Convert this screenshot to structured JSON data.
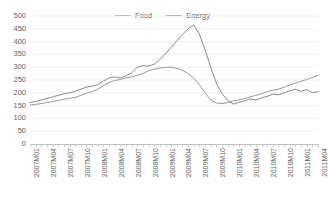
{
  "chart_data": {
    "type": "line",
    "title": "",
    "xlabel": "",
    "ylabel": "",
    "ylim": [
      0,
      500
    ],
    "ytick_step": 50,
    "yticks": [
      0,
      50,
      100,
      150,
      200,
      250,
      300,
      350,
      400,
      450,
      500
    ],
    "grid": true,
    "legend_position": "top-center",
    "x_tick_labels": [
      "2007M01",
      "2007M04",
      "2007M07",
      "2007M10",
      "2008M01",
      "2008M04",
      "2008M07",
      "2008M10",
      "2009M01",
      "2009M04",
      "2009M07",
      "2009M10",
      "2010M01",
      "2010M04",
      "2010M07",
      "2010M10",
      "2011M01",
      "2011M04"
    ],
    "x": [
      "2007M01",
      "2007M02",
      "2007M03",
      "2007M04",
      "2007M05",
      "2007M06",
      "2007M07",
      "2007M08",
      "2007M09",
      "2007M10",
      "2007M11",
      "2007M12",
      "2008M01",
      "2008M02",
      "2008M03",
      "2008M04",
      "2008M05",
      "2008M06",
      "2008M07",
      "2008M08",
      "2008M09",
      "2008M10",
      "2008M11",
      "2008M12",
      "2009M01",
      "2009M02",
      "2009M03",
      "2009M04",
      "2009M05",
      "2009M06",
      "2009M07",
      "2009M08",
      "2009M09",
      "2009M10",
      "2009M11",
      "2009M12",
      "2010M01",
      "2010M02",
      "2010M03",
      "2010M04",
      "2010M05",
      "2010M06",
      "2010M07",
      "2010M08",
      "2010M09",
      "2010M10",
      "2010M11",
      "2010M12",
      "2011M01",
      "2011M02",
      "2011M03",
      "2011M04"
    ],
    "series": [
      {
        "name": "Food",
        "color": "#8c8c8c",
        "values": [
          152,
          155,
          158,
          162,
          166,
          170,
          175,
          178,
          182,
          190,
          198,
          205,
          214,
          228,
          240,
          248,
          252,
          258,
          262,
          268,
          275,
          286,
          292,
          297,
          299,
          300,
          296,
          288,
          275,
          258,
          232,
          200,
          172,
          160,
          158,
          162,
          168,
          172,
          178,
          184,
          190,
          196,
          205,
          210,
          214,
          222,
          230,
          238,
          245,
          252,
          260,
          268
        ]
      },
      {
        "name": "Energy",
        "color": "#7d7d7d",
        "values": [
          162,
          166,
          172,
          178,
          184,
          190,
          196,
          200,
          206,
          214,
          222,
          226,
          232,
          246,
          258,
          262,
          258,
          266,
          278,
          300,
          306,
          304,
          312,
          330,
          352,
          378,
          402,
          428,
          450,
          465,
          430,
          368,
          300,
          238,
          196,
          170,
          156,
          163,
          168,
          176,
          172,
          180,
          186,
          195,
          192,
          200,
          208,
          214,
          206,
          212,
          200,
          205
        ]
      }
    ],
    "series_late_note": ""
  },
  "legend": {
    "entries": [
      {
        "label": "Food",
        "icon": "line-swatch-icon"
      },
      {
        "label": "Energy",
        "icon": "line-swatch-icon"
      }
    ]
  }
}
